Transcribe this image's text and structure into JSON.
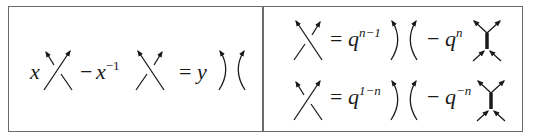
{
  "diagram": {
    "left_panel": {
      "name": "HOMFLY skein relation",
      "terms": [
        {
          "coef_var": "x",
          "coef_exp": "",
          "sign": "",
          "diagram": "positive-crossing"
        },
        {
          "coef_var": "x",
          "coef_exp": "−1",
          "sign": "−",
          "diagram": "negative-crossing"
        },
        {
          "coef_var": "y",
          "coef_exp": "",
          "sign": "=",
          "diagram": "smoothing"
        }
      ],
      "text": {
        "x": "x",
        "minus": "−",
        "x_inv_base": "x",
        "x_inv_exp": "−1",
        "equals": "=",
        "y": "y"
      }
    },
    "right_panel": {
      "name": "Crossing expansions (MOY)",
      "rows": [
        {
          "lhs": "positive-crossing",
          "equals": "=",
          "q1_base": "q",
          "q1_exp": "n−1",
          "minus": "−",
          "q2_base": "q",
          "q2_exp": "n",
          "rhs_diagrams": [
            "smoothing",
            "thick-edge-web"
          ]
        },
        {
          "lhs": "negative-crossing",
          "equals": "=",
          "q1_base": "q",
          "q1_exp": "1−n",
          "minus": "−",
          "q2_base": "q",
          "q2_exp": "−n",
          "rhs_diagrams": [
            "smoothing",
            "thick-edge-web"
          ]
        }
      ]
    },
    "colors": {
      "stroke": "#1a1a1a",
      "border": "#6a6a6a",
      "background": "#ffffff"
    }
  }
}
